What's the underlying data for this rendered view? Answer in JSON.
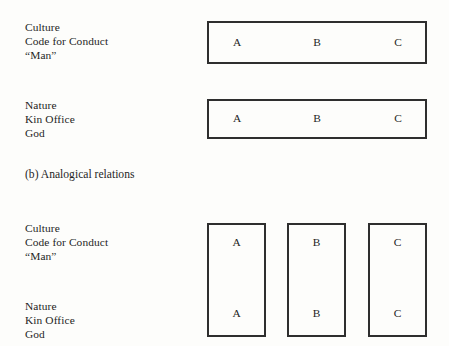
{
  "figure": {
    "caption": "(b) Analogical relations",
    "colors": {
      "background": "#fdfdfb",
      "ink": "#1f1f1f",
      "box_border": "#2e2e2e"
    },
    "section_a": {
      "rows": [
        {
          "label_lines": [
            "Culture",
            "Code for Conduct",
            "“Man”"
          ],
          "band_letters": [
            "A",
            "B",
            "C"
          ]
        },
        {
          "label_lines": [
            "Nature",
            "Kin Office",
            "God"
          ],
          "band_letters": [
            "A",
            "B",
            "C"
          ]
        }
      ]
    },
    "section_b": {
      "rows": [
        {
          "label_lines": [
            "Culture",
            "Code for Conduct",
            "“Man”"
          ]
        },
        {
          "label_lines": [
            "Nature",
            "Kin Office",
            "God"
          ]
        }
      ],
      "columns": [
        {
          "name": "column-a",
          "top_letter": "A",
          "bottom_letter": "A"
        },
        {
          "name": "column-b",
          "top_letter": "B",
          "bottom_letter": "B"
        },
        {
          "name": "column-c",
          "top_letter": "C",
          "bottom_letter": "C"
        }
      ]
    }
  }
}
